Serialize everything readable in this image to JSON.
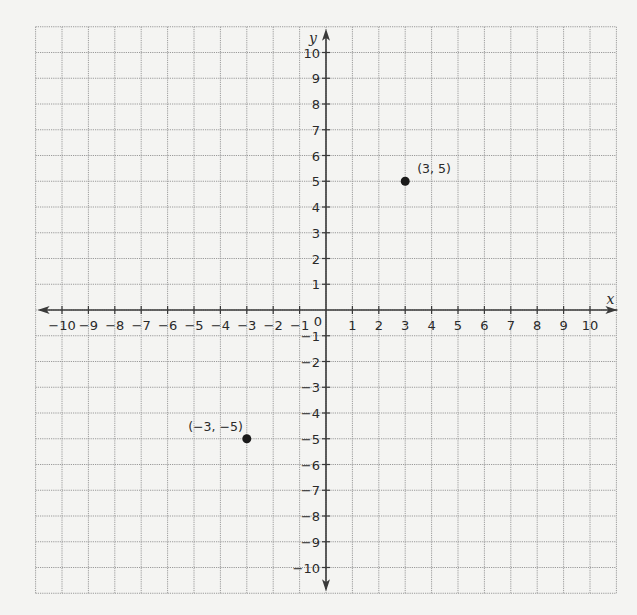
{
  "chart_data": {
    "type": "scatter",
    "title": "",
    "xlabel": "x",
    "ylabel": "y",
    "xlim": [
      -11,
      11
    ],
    "ylim": [
      -11,
      11
    ],
    "grid": true,
    "x_ticks": [
      -10,
      -9,
      -8,
      -7,
      -6,
      -5,
      -4,
      -3,
      -2,
      -1,
      1,
      2,
      3,
      4,
      5,
      6,
      7,
      8,
      9,
      10
    ],
    "y_ticks": [
      10,
      9,
      8,
      7,
      6,
      5,
      4,
      3,
      2,
      1,
      -1,
      -2,
      -3,
      -4,
      -5,
      -6,
      -7,
      -8,
      -9,
      -10
    ],
    "origin_label": "0",
    "points": [
      {
        "x": 3,
        "y": 5,
        "label": "(3, 5)"
      },
      {
        "x": -3,
        "y": -5,
        "label": "(−3, −5)"
      }
    ],
    "colors": {
      "background": "#f4f4f2",
      "grid": "#9a9a9a",
      "axis": "#3a3a3a",
      "point": "#1a1a1a"
    }
  }
}
